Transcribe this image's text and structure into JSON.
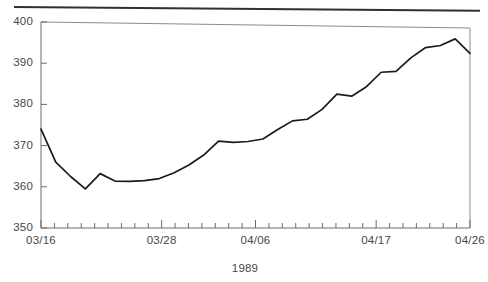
{
  "figure": {
    "name": "time-series-line-chart",
    "top_rule_present": true,
    "ink_color": "#1d1b1a",
    "axis_color": "#6e6c6a",
    "background": "#ffffff"
  },
  "chart_data": {
    "type": "line",
    "title": "",
    "subtitle": "",
    "xlabel": "1989",
    "ylabel": "",
    "ylim": [
      350,
      400
    ],
    "ytick_labels": [
      "350",
      "360",
      "370",
      "380",
      "390",
      "400"
    ],
    "ytick_values": [
      350,
      360,
      370,
      380,
      390,
      400
    ],
    "xtick_labels": [
      "03/16",
      "03/28",
      "04/06",
      "04/17",
      "04/26"
    ],
    "xtick_label_positions": [
      0,
      9,
      16,
      25,
      32
    ],
    "minor_tick_count": 33,
    "grid": false,
    "legend": null,
    "x": [
      "03/16",
      "03/17",
      "03/20",
      "03/21",
      "03/22",
      "03/23",
      "03/24",
      "03/27",
      "03/28",
      "03/29",
      "03/30",
      "03/31",
      "04/03",
      "04/04",
      "04/05",
      "04/06",
      "04/07",
      "04/10",
      "04/11",
      "04/12",
      "04/13",
      "04/14",
      "04/17",
      "04/18",
      "04/19",
      "04/20",
      "04/21",
      "04/24",
      "04/25",
      "04/26"
    ],
    "values": [
      374.0,
      366.0,
      362.5,
      359.5,
      363.2,
      361.4,
      361.3,
      361.5,
      362.0,
      363.4,
      365.3,
      367.7,
      371.1,
      370.8,
      371.0,
      371.6,
      373.9,
      376.0,
      376.4,
      378.8,
      382.5,
      382.0,
      384.3,
      387.8,
      388.0,
      391.3,
      393.8,
      394.3,
      395.9,
      392.4
    ],
    "series": [
      {
        "name": "series-1",
        "values": [
          374.0,
          366.0,
          362.5,
          359.5,
          363.2,
          361.4,
          361.3,
          361.5,
          362.0,
          363.4,
          365.3,
          367.7,
          371.1,
          370.8,
          371.0,
          371.6,
          373.9,
          376.0,
          376.4,
          378.8,
          382.5,
          382.0,
          384.3,
          387.8,
          388.0,
          391.3,
          393.8,
          394.3,
          395.9,
          392.4
        ]
      }
    ],
    "min_value": 359.5,
    "max_value": 395.9,
    "start_value": 374.0,
    "end_value": 392.4
  }
}
